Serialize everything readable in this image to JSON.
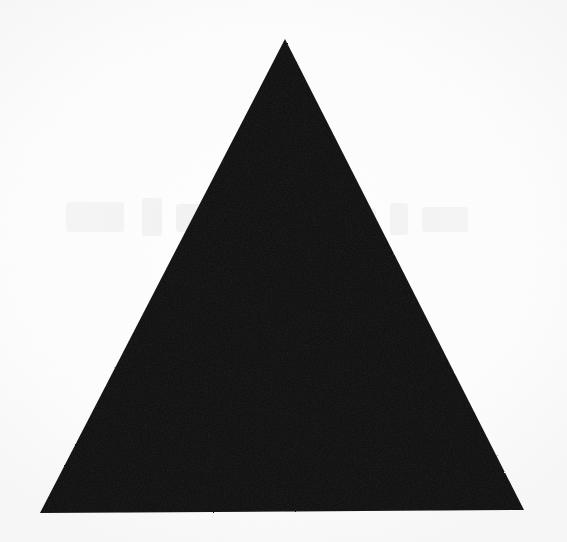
{
  "figure": {
    "kind": "scanned-geometric-figure",
    "shape_name": "triangle",
    "orientation": "apex-up",
    "fill_style": "solid",
    "caption": "",
    "canvas": {
      "width": 567,
      "height": 542
    },
    "colors": {
      "shape_fill": "#0d0d0d",
      "shape_edge": "#141414",
      "paper_background": "#fefefe",
      "paper_shadow": "#f3f3f4",
      "ghost_ink": "#e6e4e6"
    },
    "geometry": {
      "vertices": [
        {
          "name": "apex",
          "x": 285,
          "y": 39
        },
        {
          "name": "base-right",
          "x": 524,
          "y": 510
        },
        {
          "name": "base-left",
          "x": 40,
          "y": 513
        }
      ],
      "points_attr": "285,39 524,510 40,513",
      "base_width_px": 484,
      "height_px": 472,
      "tilt_degrees": 0.35,
      "approx_type": "equilateral"
    },
    "artifacts": {
      "paper_grain": true,
      "bleed_through_ghosting": true,
      "ghost_region": {
        "x": 60,
        "y": 188,
        "width": 440,
        "height": 70
      }
    }
  }
}
